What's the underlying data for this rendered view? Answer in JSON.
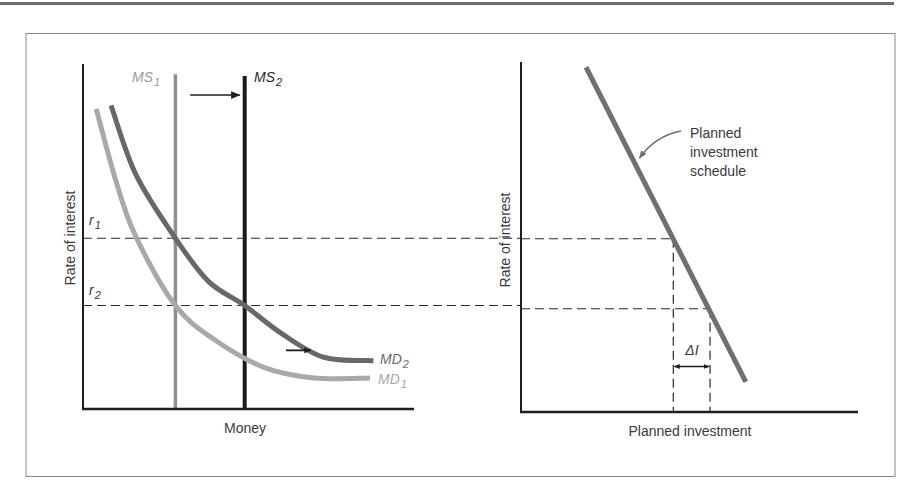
{
  "colors": {
    "axis": "#1e1e1e",
    "ms1": "#8f8f8f",
    "ms2": "#1a1a1a",
    "md1": "#a9a9a9",
    "md2": "#686868",
    "investment": "#707070",
    "frame": "#8a8a8a",
    "text": "#3a3a3a",
    "label_light": "#9a9a9a"
  },
  "chart_data": [
    {
      "type": "line",
      "title": "Money market",
      "xlabel": "Money",
      "ylabel": "Rate of interest",
      "ticks": {
        "y": [
          {
            "label": "r",
            "sub": "1",
            "value": 0.495
          },
          {
            "label": "r",
            "sub": "2",
            "value": 0.3
          }
        ]
      },
      "xlim": [
        0,
        1
      ],
      "ylim": [
        0,
        1
      ],
      "grid": false,
      "series": [
        {
          "name": "MS1",
          "label": "MS",
          "sub": "1",
          "kind": "vertical",
          "x": 0.28,
          "y_top": 0.97
        },
        {
          "name": "MS2",
          "label": "MS",
          "sub": "2",
          "kind": "vertical",
          "x": 0.49,
          "y_top": 0.965
        },
        {
          "name": "MD1",
          "label": "MD",
          "sub": "1",
          "kind": "curve",
          "points": [
            [
              0.04,
              0.87
            ],
            [
              0.1,
              0.66
            ],
            [
              0.16,
              0.5
            ],
            [
              0.28,
              0.3
            ],
            [
              0.4,
              0.2
            ],
            [
              0.55,
              0.12
            ],
            [
              0.7,
              0.09
            ],
            [
              0.87,
              0.09
            ]
          ]
        },
        {
          "name": "MD2",
          "label": "MD",
          "sub": "2",
          "kind": "curve",
          "points": [
            [
              0.085,
              0.88
            ],
            [
              0.16,
              0.68
            ],
            [
              0.28,
              0.495
            ],
            [
              0.38,
              0.37
            ],
            [
              0.49,
              0.3
            ],
            [
              0.6,
              0.22
            ],
            [
              0.73,
              0.15
            ],
            [
              0.88,
              0.14
            ]
          ]
        }
      ],
      "annotations": [
        {
          "type": "arrow",
          "meaning": "money supply shift right",
          "from": [
            0.325,
            0.91
          ],
          "to": [
            0.475,
            0.91
          ]
        },
        {
          "type": "arrow",
          "meaning": "money demand shift right",
          "from": [
            0.615,
            0.17
          ],
          "to": [
            0.69,
            0.17
          ]
        },
        {
          "type": "dashed-h",
          "level": "r1",
          "y": 0.495
        },
        {
          "type": "dashed-h",
          "level": "r2",
          "y": 0.3
        }
      ]
    },
    {
      "type": "line",
      "title": "Investment market",
      "xlabel": "Planned investment",
      "ylabel": "Rate of interest",
      "xlim": [
        0,
        1
      ],
      "ylim": [
        0,
        1
      ],
      "grid": false,
      "series": [
        {
          "name": "Planned investment schedule",
          "kind": "line",
          "points": [
            [
              0.193,
              0.985
            ],
            [
              0.667,
              0.086
            ]
          ]
        }
      ],
      "callout": {
        "lines": [
          "Planned",
          "investment",
          "schedule"
        ],
        "points_to": [
          0.346,
          0.72
        ]
      },
      "delta": {
        "label": "ΔI",
        "x1": 0.452,
        "x2": 0.561,
        "y1": 0.495,
        "y2": 0.295,
        "arrow_y": 0.13
      },
      "annotations": [
        {
          "type": "dashed-h",
          "level": "r1",
          "y": 0.495
        },
        {
          "type": "dashed-h",
          "level": "r2",
          "y": 0.295
        }
      ]
    }
  ]
}
